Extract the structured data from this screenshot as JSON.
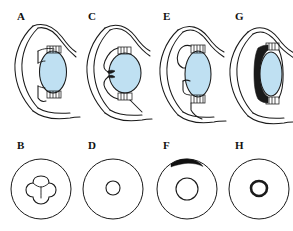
{
  "figure": {
    "background_color": "#ffffff",
    "line_color": "#1a1a1a",
    "lens_color": "#bfe0f2",
    "dark_fill_color": "#101010"
  },
  "panels": [
    {
      "id": "A",
      "label": "A",
      "type": "cross-section",
      "row": "top",
      "column": 1,
      "lens_shape": "biconvex-relaxed",
      "lens_color": "#bfe0f2",
      "iris_state": "normal",
      "notes": "Sagittal section of anterior eye with cornea, iris and relaxed crystalline lens"
    },
    {
      "id": "B",
      "label": "B",
      "type": "pupil-view",
      "row": "bottom",
      "column": 1,
      "pupil_shape": "trefoil",
      "pupil_lobes": 3,
      "pupil_fill": "#ffffff",
      "pupil_outline_weight": "thin",
      "iris_circle": true,
      "crescent": false,
      "notes": "Clover/trefoil shaped pupil aperture with three lobes"
    },
    {
      "id": "C",
      "label": "C",
      "type": "cross-section",
      "row": "top",
      "column": 2,
      "lens_shape": "rounded-accommodated",
      "lens_color": "#bfe0f2",
      "iris_state": "retracted",
      "notes": "Lens more spherical, zonules slack, iris pulled back"
    },
    {
      "id": "D",
      "label": "D",
      "type": "pupil-view",
      "row": "bottom",
      "column": 2,
      "pupil_shape": "small-round",
      "pupil_lobes": 1,
      "pupil_fill": "#ffffff",
      "pupil_outline_weight": "thin",
      "iris_circle": true,
      "crescent": false,
      "notes": "Small irregular round pupil centred in iris"
    },
    {
      "id": "E",
      "label": "E",
      "type": "cross-section",
      "row": "top",
      "column": 3,
      "lens_shape": "oval-tall",
      "lens_color": "#bfe0f2",
      "iris_state": "displaced",
      "notes": "Tall oval lens with anterior iris flap displaced forward"
    },
    {
      "id": "F",
      "label": "F",
      "type": "pupil-view",
      "row": "bottom",
      "column": 3,
      "pupil_shape": "medium-round",
      "pupil_lobes": 1,
      "pupil_fill": "#ffffff",
      "pupil_outline_weight": "thin",
      "iris_circle": true,
      "crescent": true,
      "crescent_position": "superior",
      "crescent_color": "#101010",
      "notes": "Medium round pupil with dark crescent at the superior iris margin"
    },
    {
      "id": "G",
      "label": "G",
      "type": "cross-section",
      "row": "top",
      "column": 4,
      "lens_shape": "narrow-oval",
      "lens_color": "#bfe0f2",
      "iris_state": "apposed-dark",
      "notes": "Narrow lens closely apposed by thick darkened iris tissue"
    },
    {
      "id": "H",
      "label": "H",
      "type": "pupil-view",
      "row": "bottom",
      "column": 4,
      "pupil_shape": "small-round",
      "pupil_lobes": 1,
      "pupil_fill": "#ffffff",
      "pupil_outline_weight": "thick",
      "iris_circle": true,
      "crescent": false,
      "notes": "Small constricted pupil outlined by a thick dark ring"
    }
  ]
}
